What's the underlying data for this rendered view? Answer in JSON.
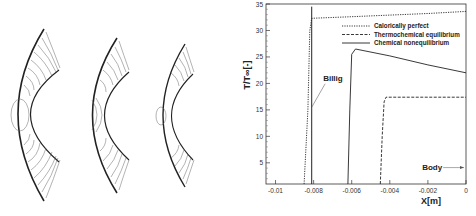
{
  "left_panel": {
    "description": "Three bow-shock contour plots around a cylinder/sphere (temperature isolines)",
    "panels": [
      {
        "name": "calorically-perfect-contours"
      },
      {
        "name": "thermochemical-equilibrium-contours"
      },
      {
        "name": "chemical-nonequilibrium-contours"
      }
    ]
  },
  "chart_data": {
    "type": "line",
    "title": "",
    "xlabel": "X[m]",
    "ylabel": "T/T∞[-]",
    "xlim": [
      -0.0105,
      0
    ],
    "ylim": [
      1,
      35
    ],
    "x_ticks": [
      "-0.01",
      "-0.008",
      "-0.006",
      "-0.004",
      "-0.002",
      "0"
    ],
    "y_ticks": [
      "5",
      "10",
      "15",
      "20",
      "25",
      "30",
      "35"
    ],
    "grid": false,
    "legend_position": "upper right",
    "series": [
      {
        "name": "Calorically perfect",
        "style": "dotted",
        "x": [
          -0.0085,
          -0.0083,
          -0.0082,
          -0.0081,
          -0.006,
          -0.004,
          -0.002,
          0
        ],
        "y": [
          1,
          15,
          30,
          32.3,
          32.6,
          32.9,
          33.2,
          33.6
        ]
      },
      {
        "name": "Thermochemical equilibrium",
        "style": "dashed",
        "x": [
          -0.0045,
          -0.0044,
          -0.0043,
          -0.0042,
          -0.002,
          0
        ],
        "y": [
          1,
          10,
          16.5,
          17.4,
          17.4,
          17.4
        ]
      },
      {
        "name": "Chemical nonequilibrium",
        "style": "solid",
        "x": [
          -0.0062,
          -0.0061,
          -0.006,
          -0.0058,
          -0.004,
          -0.002,
          0
        ],
        "y": [
          1,
          15,
          25.5,
          26.5,
          25.2,
          23.5,
          22
        ]
      }
    ],
    "vertical_lines": [
      {
        "label": "Billig",
        "x": -0.0081,
        "style": "solid",
        "y_range": [
          1,
          34.5
        ]
      }
    ],
    "annotations": [
      {
        "text": "Billig",
        "x": -0.0075,
        "y": 20.5
      },
      {
        "text": "Body",
        "x": -0.0012,
        "y": 4.1
      }
    ]
  }
}
